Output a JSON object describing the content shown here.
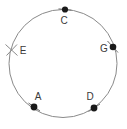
{
  "figure": {
    "type": "geometry-circle-diagram",
    "background_color": "#ffffff",
    "stroke_color": "#8a8a8a",
    "marker_color": "#1a1a1a",
    "label_color": "#3a3a3a",
    "circle": {
      "center_x": 63,
      "center_y": 63.5,
      "radius": 54,
      "stroke_width": 1
    },
    "points": [
      {
        "id": "point-c",
        "label": "C",
        "marker": "filled-dot-with-tick",
        "x": 65,
        "y": 9.5,
        "label_x": 64,
        "label_y": 21,
        "tick_angle_deg": 8
      },
      {
        "id": "point-e",
        "label": "E",
        "marker": "tick-only",
        "x": 11.5,
        "y": 50,
        "label_x": 23,
        "label_y": 51,
        "tick_angle_deg": -64
      },
      {
        "id": "point-g",
        "label": "G",
        "marker": "filled-dot-with-tick",
        "x": 113,
        "y": 47,
        "label_x": 104,
        "label_y": 49,
        "tick_angle_deg": 66
      },
      {
        "id": "point-a",
        "label": "A",
        "marker": "filled-dot-with-tick",
        "x": 34,
        "y": 107,
        "label_x": 38,
        "label_y": 97,
        "tick_angle_deg": 33
      },
      {
        "id": "point-d",
        "label": "D",
        "marker": "filled-dot-with-tick",
        "x": 94,
        "y": 108,
        "label_x": 90,
        "label_y": 97,
        "tick_angle_deg": -32
      }
    ]
  }
}
